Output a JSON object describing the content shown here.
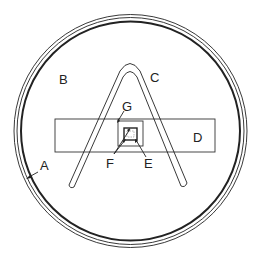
{
  "diagram": {
    "type": "technical-schematic",
    "labels": {
      "A": "A",
      "B": "B",
      "C": "C",
      "D": "D",
      "E": "E",
      "F": "F",
      "G": "G"
    },
    "parts": [
      {
        "label": "A",
        "role": "outer circular rim (multi-line ring)"
      },
      {
        "label": "B",
        "role": "interior region of dish"
      },
      {
        "label": "C",
        "role": "hairpin / inverted-V wire loop"
      },
      {
        "label": "D",
        "role": "horizontal rectangular strip"
      },
      {
        "label": "E",
        "role": "inner small square (dashed contents)"
      },
      {
        "label": "F",
        "role": "pointer to inner square corners"
      },
      {
        "label": "G",
        "role": "middle square frame"
      }
    ],
    "colors": {
      "line": "#222222",
      "background": "#ffffff"
    }
  }
}
